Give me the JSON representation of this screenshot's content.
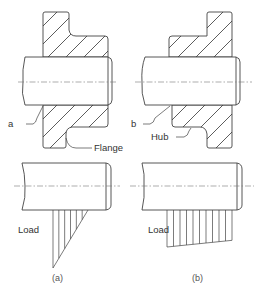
{
  "figure": {
    "panels": [
      {
        "id": "a",
        "caption": "(a)",
        "part_label": "Flange",
        "point_label": "a",
        "load_label": "Load",
        "load_distribution": "triangular",
        "load_profile": [
          1.0,
          0.0
        ]
      },
      {
        "id": "b",
        "caption": "(b)",
        "part_label": "Hub",
        "point_label": "b",
        "load_label": "Load",
        "load_distribution": "trapezoidal",
        "load_profile": [
          1.0,
          0.82
        ]
      }
    ]
  }
}
